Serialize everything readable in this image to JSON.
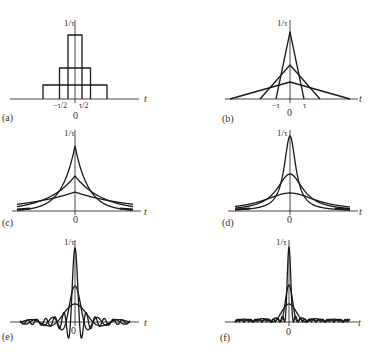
{
  "figure": {
    "y_label": "1/τ",
    "x_label": "t",
    "origin_label": "0",
    "panels": [
      {
        "id": "a",
        "label": "(a)",
        "shape": "rectangular pulses",
        "tick_labels": [
          "−τ/2",
          "τ/2"
        ]
      },
      {
        "id": "b",
        "label": "(b)",
        "shape": "triangular pulses",
        "tick_labels": [
          "−τ",
          "τ"
        ]
      },
      {
        "id": "c",
        "label": "(c)",
        "shape": "two-sided exponential pulses",
        "tick_labels": []
      },
      {
        "id": "d",
        "label": "(d)",
        "shape": "Gaussian-like / Lorentzian pulses",
        "tick_labels": []
      },
      {
        "id": "e",
        "label": "(e)",
        "shape": "sinc pulses",
        "tick_labels": []
      },
      {
        "id": "f",
        "label": "(f)",
        "shape": "sinc-squared pulses",
        "tick_labels": []
      }
    ],
    "colors": {
      "line": "#1a1a1a",
      "background": "#ffffff"
    }
  }
}
